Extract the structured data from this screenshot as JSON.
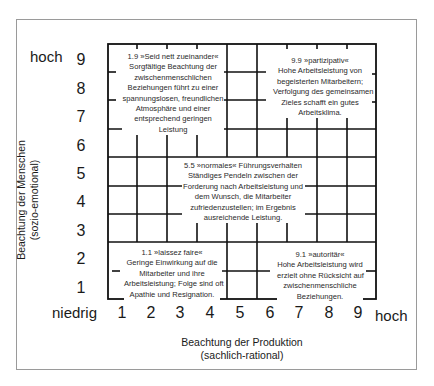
{
  "diagram": {
    "y_axis": {
      "title_line1": "Beachtung der Menschen",
      "title_line2": "(sozio-emotional)",
      "high_label": "hoch",
      "ticks": [
        "9",
        "8",
        "7",
        "6",
        "5",
        "4",
        "3",
        "2",
        "1"
      ]
    },
    "x_axis": {
      "title_line1": "Beachtung der Produktion",
      "title_line2": "(sachlich-rational)",
      "low_label": "niedrig",
      "high_label": "hoch",
      "ticks": [
        "1",
        "2",
        "3",
        "4",
        "5",
        "6",
        "7",
        "8",
        "9"
      ]
    },
    "styles": [
      {
        "id": "1.9",
        "lines": [
          "1.9 »Seid nett zueinander«",
          "Sorgfältige Beachtung der",
          "zwischenmenschlichen",
          "Beziehungen führt zu einer",
          "spannungslosen, freundlichen",
          "Atmosphäre und einer",
          "entsprechend geringen",
          "Leistung"
        ]
      },
      {
        "id": "9.9",
        "lines": [
          "9.9 »partizipativ«",
          "Hohe Arbeitsleistung von",
          "begeisterten Mitarbeitern;",
          "Verfolgung des gemeinsamen",
          "Zieles schafft ein gutes",
          "Arbeitsklima."
        ]
      },
      {
        "id": "5.5",
        "lines": [
          "5.5 »normales« Führungsverhalten",
          "Ständiges Pendeln zwischen der",
          "Forderung nach Arbeitsleistung und",
          "dem Wunsch, die Mitarbeiter",
          "zufriedenzustellen; im Ergebnis",
          "ausreichende Leistung."
        ]
      },
      {
        "id": "1.1",
        "lines": [
          "1.1 »laissez faire«",
          "Geringe Einwirkung auf die",
          "Mitarbeiter und ihre",
          "Arbeitsleistung; Folge sind oft",
          "Apathie und Resignation."
        ]
      },
      {
        "id": "9.1",
        "lines": [
          "9.1 »autoritär«",
          "Hohe Arbeitsleistung wird",
          "erzielt ohne Rücksicht auf",
          "zwischenmenschliche",
          "Beziehungen."
        ]
      }
    ],
    "colors": {
      "line": "#111111",
      "frame": "#9a9a9a",
      "text": "#2a2a2a"
    }
  }
}
